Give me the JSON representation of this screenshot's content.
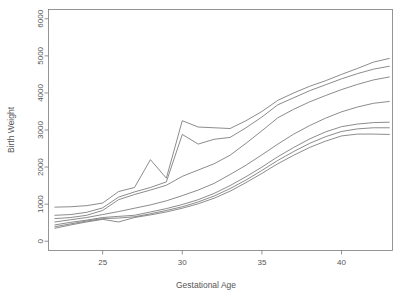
{
  "chart_data": {
    "type": "line",
    "title": "",
    "xlabel": "Gestational Age",
    "ylabel": "Birth Weight",
    "xlim": [
      21.6,
      43.2
    ],
    "ylim": [
      -250,
      6250
    ],
    "xticks": [
      25,
      30,
      35,
      40
    ],
    "yticks": [
      0,
      1000,
      2000,
      3000,
      4000,
      5000,
      6000
    ],
    "xtick_labels": [
      "25",
      "30",
      "35",
      "40"
    ],
    "ytick_labels": [
      "0",
      "1000",
      "2000",
      "3000",
      "4000",
      "5000",
      "6000"
    ],
    "grid": false,
    "legend": "none",
    "x": [
      22,
      23,
      24,
      25,
      26,
      27,
      28,
      29,
      30,
      31,
      32,
      33,
      34,
      35,
      36,
      37,
      38,
      39,
      40,
      41,
      42,
      43
    ],
    "series": [
      {
        "name": "curve-1-upper-extreme",
        "values": [
          920,
          930,
          960,
          1030,
          1340,
          1450,
          2200,
          1700,
          3250,
          3080,
          3060,
          3040,
          3250,
          3500,
          3800,
          4000,
          4180,
          4330,
          4500,
          4660,
          4830,
          4930
        ]
      },
      {
        "name": "curve-2-upper",
        "values": [
          700,
          720,
          780,
          900,
          1190,
          1330,
          1450,
          1600,
          2880,
          2620,
          2750,
          2800,
          3060,
          3350,
          3680,
          3870,
          4060,
          4220,
          4380,
          4520,
          4640,
          4720
        ]
      },
      {
        "name": "curve-3-upper-mid",
        "values": [
          610,
          640,
          700,
          830,
          1120,
          1260,
          1380,
          1510,
          1750,
          1920,
          2090,
          2320,
          2640,
          2980,
          3330,
          3560,
          3760,
          3930,
          4090,
          4230,
          4350,
          4430
        ]
      },
      {
        "name": "curve-4-median",
        "values": [
          520,
          580,
          640,
          720,
          800,
          890,
          980,
          1090,
          1230,
          1380,
          1560,
          1800,
          2050,
          2330,
          2620,
          2890,
          3120,
          3320,
          3490,
          3620,
          3720,
          3770
        ]
      },
      {
        "name": "curve-5-lower-mid",
        "values": [
          440,
          510,
          570,
          640,
          670,
          700,
          790,
          880,
          990,
          1120,
          1290,
          1500,
          1740,
          2000,
          2280,
          2530,
          2760,
          2950,
          3090,
          3160,
          3200,
          3210
        ]
      },
      {
        "name": "curve-6-lower",
        "values": [
          390,
          470,
          545,
          610,
          625,
          660,
          740,
          830,
          930,
          1060,
          1220,
          1420,
          1650,
          1910,
          2180,
          2420,
          2640,
          2820,
          2960,
          3030,
          3060,
          3060
        ]
      },
      {
        "name": "curve-7-lower-extreme",
        "values": [
          350,
          440,
          520,
          590,
          520,
          640,
          710,
          790,
          890,
          1010,
          1160,
          1350,
          1580,
          1830,
          2090,
          2320,
          2530,
          2700,
          2840,
          2890,
          2890,
          2880
        ]
      }
    ]
  },
  "axes": {
    "x_title": "Gestational Age",
    "y_title": "Birth Weight"
  }
}
